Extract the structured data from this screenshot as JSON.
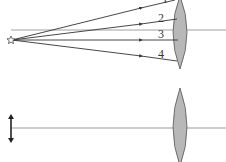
{
  "diagrams": [
    {
      "name": "top-panel",
      "description": "Point source emitting four rays toward a converging lens",
      "source": {
        "icon": "star-source-icon",
        "x": 11,
        "y": 40
      },
      "optical_axis_y": 30,
      "lens": {
        "cx": 180,
        "top": -4,
        "bottom": 69,
        "half_width": 7
      },
      "rays": [
        {
          "label": "1",
          "end": [
            175,
            1
          ],
          "label_pos": [
            162,
            3
          ]
        },
        {
          "label": "2",
          "end": [
            177,
            18
          ],
          "label_pos": [
            161,
            22
          ]
        },
        {
          "label": "3",
          "end": [
            178,
            40
          ],
          "label_pos": [
            160,
            40
          ]
        },
        {
          "label": "4",
          "end": [
            177,
            61
          ],
          "label_pos": [
            161,
            59
          ]
        }
      ]
    },
    {
      "name": "bottom-panel",
      "description": "Object arrow on optical axis with a converging lens",
      "object": {
        "icon": "double-arrow-object-icon",
        "x": 11,
        "top": 115,
        "bottom": 142
      },
      "optical_axis_y": 128,
      "lens": {
        "cx": 180,
        "top": 88,
        "bottom": 166,
        "half_width": 7
      }
    }
  ],
  "colors": {
    "line": "#333333",
    "axis": "#888888",
    "lens_fill": "#b8b8b8",
    "lens_stroke": "#555555"
  }
}
